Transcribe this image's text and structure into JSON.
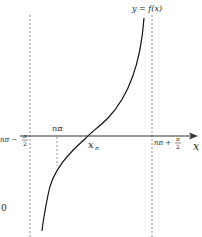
{
  "diagram": {
    "curve_label": "y = f(x)",
    "axis_label": "x",
    "root_label": "x",
    "root_subscript": "n",
    "center_label": "nπ",
    "left_asymptote": {
      "prefix": "nπ − ",
      "frac_num": "π",
      "frac_den": "2"
    },
    "right_asymptote": {
      "prefix": "nπ + ",
      "frac_num": "π",
      "frac_den": "2"
    },
    "corner_label": "0",
    "colors": {
      "curve": "#111111",
      "axis": "#333333",
      "dashed": "#777777",
      "text": "#222222"
    }
  }
}
